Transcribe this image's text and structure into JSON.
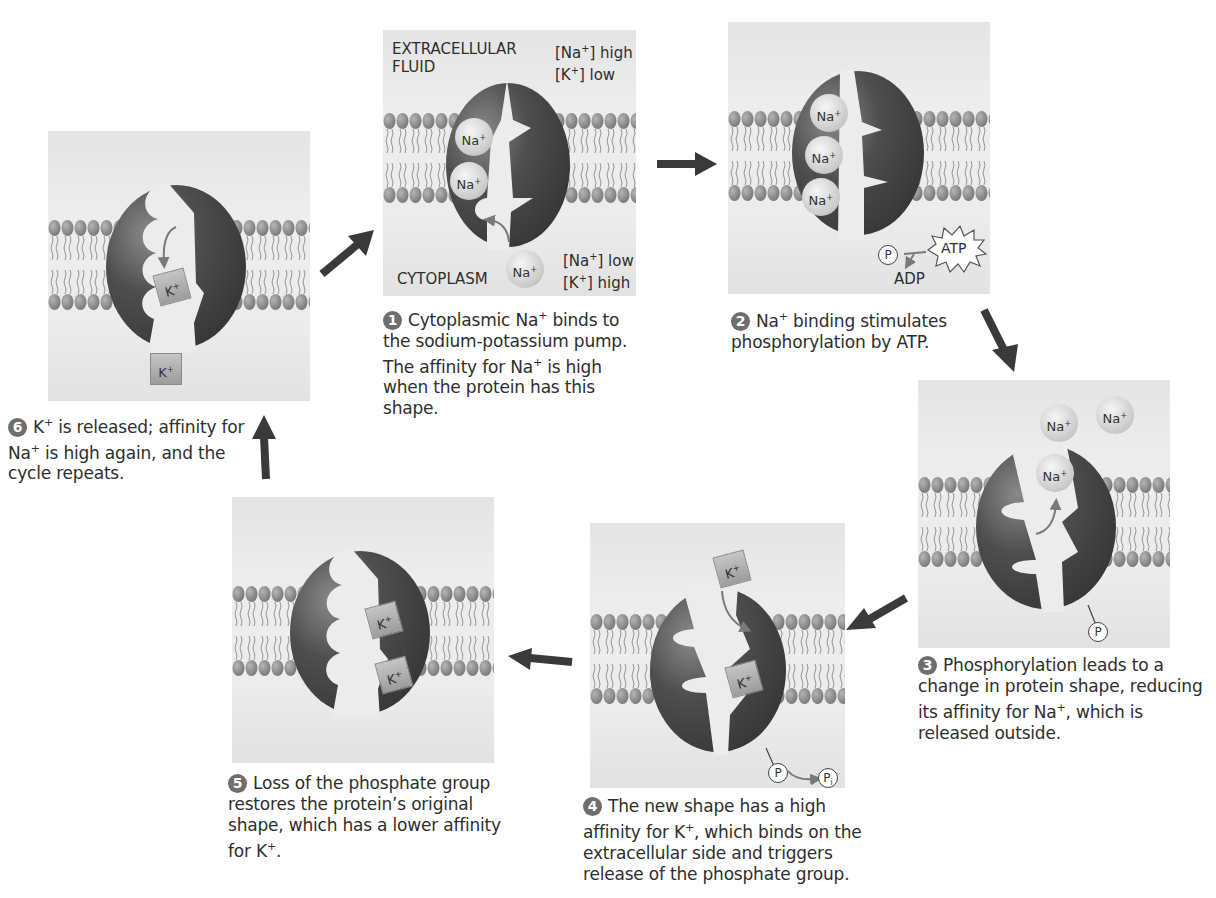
{
  "colors": {
    "panel_bg": "#ececec",
    "protein_dark": "#3f3f3f",
    "protein_light": "#6a6a6a",
    "membrane_head": "#8c8c8c",
    "arrow": "#3a3a3a",
    "step_badge": "#6e6e6e"
  },
  "panels": [
    {
      "step": "1",
      "labels": {
        "top_left": "EXTRACELLULAR\nFLUID",
        "top_left_line1": "EXTRACELLULAR",
        "top_left_line2": "FLUID",
        "top_right_line1_ion": "[Na",
        "top_right_line1_rest": "] high",
        "top_right_line2_ion": "[K",
        "top_right_line2_rest": "] low",
        "bottom_left": "CYTOPLASM",
        "bottom_right_line1_ion": "[Na",
        "bottom_right_line1_rest": "] low",
        "bottom_right_line2_ion": "[K",
        "bottom_right_line2_rest": "] high"
      },
      "ions": [
        "Na+",
        "Na+",
        "Na+"
      ],
      "caption": [
        "Cytoplasmic Na",
        "+",
        " binds to the sodium-potassium pump. The affinity for Na",
        "+",
        " is high when the protein has this shape."
      ]
    },
    {
      "step": "2",
      "ions": [
        "Na+",
        "Na+",
        "Na+"
      ],
      "phosphate": "P",
      "atp": "ATP",
      "adp": "ADP",
      "caption": [
        "Na",
        "+",
        " binding stimulates phosphorylation by ATP."
      ]
    },
    {
      "step": "3",
      "ions": [
        "Na+",
        "Na+",
        "Na+"
      ],
      "phosphate": "P",
      "caption": [
        "Phosphorylation leads to a change in protein shape, reducing its affinity for Na",
        "+",
        ", which is released outside."
      ]
    },
    {
      "step": "4",
      "ions": [
        "K+",
        "K+"
      ],
      "phosphate": "P",
      "phosphate_released": "P",
      "phosphate_released_sub": "i",
      "caption": [
        "The new shape has a high affinity for K",
        "+",
        ", which binds on the extracellular side and triggers release of the phosphate group."
      ]
    },
    {
      "step": "5",
      "ions": [
        "K+",
        "K+"
      ],
      "caption": [
        "Loss of the phosphate group restores the protein’s original shape, which has a lower affinity for K",
        "+",
        "."
      ]
    },
    {
      "step": "6",
      "ions": [
        "K+",
        "K+"
      ],
      "caption": [
        "K",
        "+",
        " is released; affinity for Na",
        "+",
        " is high again, and the cycle repeats."
      ]
    }
  ],
  "ion_text": {
    "na": "Na",
    "k": "K",
    "plus": "+"
  }
}
